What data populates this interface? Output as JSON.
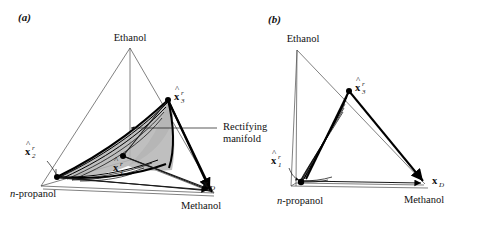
{
  "figure": {
    "type": "scientific-diagram",
    "panels": [
      {
        "id": "a",
        "label": "(a)",
        "projection": "3d-tetrahedron",
        "vertex_labels": {
          "top": "Ethanol",
          "left": "n-propanol",
          "right": "Methanol"
        },
        "point_labels": [
          {
            "name": "x3r",
            "base": "x",
            "hat": "^",
            "sub": "3",
            "sup": "r"
          },
          {
            "name": "x2r",
            "base": "x",
            "hat": "^",
            "sub": "2",
            "sup": "r"
          },
          {
            "name": "x1r",
            "base": "x",
            "hat": "^",
            "sub": "1",
            "sup": "r"
          },
          {
            "name": "xD",
            "base": "x",
            "hat": "",
            "sub": "D",
            "sup": ""
          }
        ],
        "annotation": {
          "line1": "Rectifying",
          "line2": "manifold",
          "arrow": "left-arrow"
        }
      },
      {
        "id": "b",
        "label": "(b)",
        "projection": "2d-triangle",
        "vertex_labels": {
          "top": "Ethanol",
          "left": "n-propanol",
          "right": "Methanol"
        },
        "point_labels": [
          {
            "name": "x3r",
            "base": "x",
            "hat": "^",
            "sub": "3",
            "sup": "r"
          },
          {
            "name": "x1r",
            "base": "x",
            "hat": "^",
            "sub": "1",
            "sup": "r"
          },
          {
            "name": "xD",
            "base": "x",
            "hat": "",
            "sub": "D",
            "sup": ""
          }
        ],
        "annotation": {
          "arrow": "curved-arrow-to-x1r"
        }
      }
    ],
    "colors": {
      "background": "#ffffff",
      "ink": "#111111",
      "thin_edge": "#4a4a4a",
      "manifold_shade": "#b4b4b4"
    },
    "text": {
      "panel_a_label": "(a)",
      "panel_b_label": "(b)",
      "ethanol": "Ethanol",
      "methanol": "Methanol",
      "npropanol_italic": "n",
      "npropanol_rest": "-propanol",
      "rectifying": "Rectifying",
      "manifold": "manifold",
      "x_glyph": "x",
      "hat_glyph": "^",
      "sub_1": "1",
      "sub_2": "2",
      "sub_3": "3",
      "sub_D": "D",
      "sup_r": "r"
    }
  }
}
